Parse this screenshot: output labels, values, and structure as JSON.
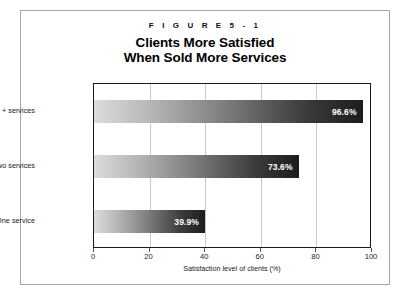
{
  "figure": {
    "number": "F I G U R E   5 - 1",
    "title_line1": "Clients More Satisfied",
    "title_line2": "When Sold More Services",
    "source": "SOURCE: RUSS ALAN PRINCE ANALYSIS; CEG WORLDWIDE, LLC."
  },
  "chart_data": {
    "type": "bar",
    "orientation": "horizontal",
    "title": "Clients More Satisfied When Sold More Services",
    "categories": [
      "Three + services",
      "Two services",
      "One service"
    ],
    "values": [
      96.6,
      73.6,
      39.9
    ],
    "value_labels": [
      "96.6%",
      "73.6%",
      "39.9%"
    ],
    "xlabel": "Satisfaction level of clients (%)",
    "ylabel": "",
    "xlim": [
      0,
      100
    ],
    "xticks": [
      0,
      20,
      40,
      60,
      80,
      100
    ],
    "xtick_labels": [
      "0",
      "20",
      "40",
      "60",
      "80",
      "100"
    ],
    "grid": "vertical",
    "legend": "none",
    "bar_fill": "gradient light-gray to near-black, left to right",
    "colors": {
      "bar_gradient_start": "#dcdcdc",
      "bar_gradient_end": "#1c1c1c",
      "value_label": "#ffffff",
      "plot_border": "#1a1a1a",
      "gridline": "#c9c9c9",
      "frame": "#a6a6a6",
      "text": "#111111"
    }
  }
}
